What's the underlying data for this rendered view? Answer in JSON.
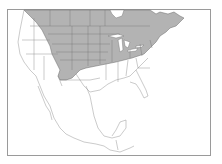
{
  "map": {
    "type": "range-map",
    "region": "North America",
    "colors": {
      "background": "#ffffff",
      "range_fill": "#b3b3b3",
      "outside_fill": "#ffffff",
      "border_line": "#555555",
      "frame": "#9a9a9a"
    },
    "shaded_region_description": "Southern Canada, northern and central United States, Great Plains, Midwest, Great Lakes and Northeast",
    "unshaded_region_description": "Western US, Southwest, Southeast, Mexico, Central America"
  }
}
